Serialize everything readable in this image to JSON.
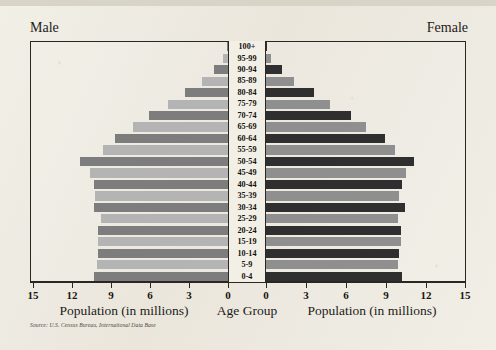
{
  "page": {
    "ghost_title": "",
    "male_label": "Male",
    "female_label": "Female",
    "source": "Source: U.S. Census Bureau, International Data Base"
  },
  "colors": {
    "dark_bar": "#2f2f2f",
    "light_bar": "#8f8f8f",
    "frame": "#2a2722",
    "paper": "#f1eee6",
    "text": "#1d1b18"
  },
  "chart_data": {
    "type": "bar",
    "subtype": "population-pyramid",
    "title": "",
    "center_axis_title": "Age Group",
    "xlabel_left": "Population (in millions)",
    "xlabel_right": "Population (in millions)",
    "ylabel": "Age Group",
    "grid": false,
    "legend_position": "none",
    "xlim_left": [
      15,
      0
    ],
    "xlim_right": [
      0,
      15
    ],
    "ticks_left": [
      "15",
      "12",
      "9",
      "6",
      "3",
      "0"
    ],
    "ticks_right": [
      "0",
      "3",
      "6",
      "9",
      "12",
      "15"
    ],
    "tick_values": [
      0,
      3,
      6,
      9,
      12,
      15
    ],
    "categories": [
      "100+",
      "95-99",
      "90-94",
      "85-89",
      "80-84",
      "75-79",
      "70-74",
      "65-69",
      "60-64",
      "55-59",
      "50-54",
      "45-49",
      "40-44",
      "35-39",
      "30-34",
      "25-29",
      "20-24",
      "15-19",
      "10-14",
      "5-9",
      "0-4"
    ],
    "series": [
      {
        "name": "Male",
        "side": "left",
        "values": [
          0.1,
          0.4,
          1.1,
          2.0,
          3.3,
          4.6,
          6.1,
          7.3,
          8.7,
          9.6,
          11.4,
          10.6,
          10.3,
          10.2,
          10.3,
          9.8,
          10.0,
          10.0,
          10.0,
          10.1,
          10.3
        ]
      },
      {
        "name": "Female",
        "side": "right",
        "values": [
          0.1,
          0.4,
          1.2,
          2.1,
          3.6,
          4.8,
          6.4,
          7.5,
          8.9,
          9.7,
          11.1,
          10.5,
          10.2,
          10.0,
          10.4,
          9.9,
          10.1,
          10.1,
          10.0,
          9.9,
          10.2
        ]
      }
    ]
  }
}
